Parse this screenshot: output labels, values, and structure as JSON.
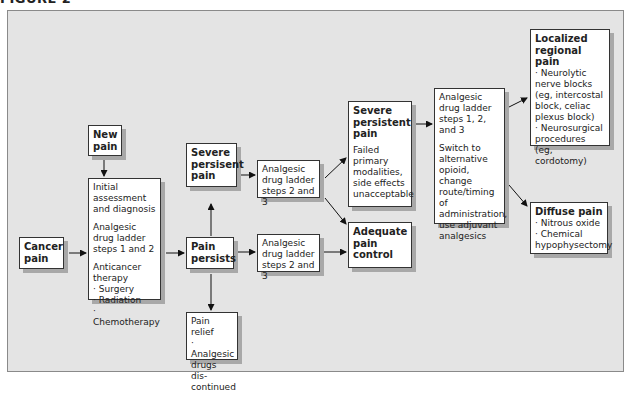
{
  "figure": {
    "title": "FIGURE 2"
  },
  "nodes": {
    "cancer_pain": {
      "title": [
        "Cancer",
        "pain"
      ]
    },
    "new_pain": {
      "title": [
        "New",
        "pain"
      ]
    },
    "initial": {
      "lines": [
        "Initial",
        "assessment",
        "and diagnosis"
      ],
      "ladder": [
        "Analgesic",
        "drug ladder",
        "steps 1 and 2"
      ],
      "therapy": [
        "Anticancer",
        "therapy",
        "· Surgery",
        "· Radiation",
        "· Chemotherapy"
      ]
    },
    "severe_left": {
      "title": [
        "Severe",
        "persisent",
        "pain"
      ]
    },
    "pain_persists": {
      "title": [
        "Pain",
        "persists"
      ]
    },
    "pain_relief": {
      "lines": [
        "Pain relief",
        "· Analgesic",
        "drugs dis-",
        "continued"
      ]
    },
    "ladder_top": {
      "lines": [
        "Analgesic",
        "drug ladder",
        "steps 2 and 3"
      ]
    },
    "ladder_bottom": {
      "lines": [
        "Analgesic",
        "drug ladder",
        "steps 2 and 3"
      ]
    },
    "severe_mid": {
      "title": [
        "Severe",
        "persistent",
        "pain"
      ],
      "lines": [
        "Failed",
        "primary",
        "modalities,",
        "side effects",
        "unacceptable"
      ]
    },
    "adequate": {
      "title": [
        "Adequate",
        "pain",
        "control"
      ]
    },
    "ladder_full": {
      "lines": [
        "Analgesic",
        "drug ladder",
        "steps 1, 2,",
        "and 3"
      ],
      "switch": [
        "Switch to",
        "alternative",
        "opioid, change",
        "route/timing of",
        "administration,",
        "use adjuvant",
        "analgesics"
      ]
    },
    "localized": {
      "title": [
        "Localized",
        "regional pain"
      ],
      "lines": [
        "· Neurolytic",
        "nerve blocks",
        "(eg, intercostal",
        "block, celiac",
        "plexus block)",
        "· Neurosurgical",
        "procedures",
        "(eg, cordotomy)"
      ]
    },
    "diffuse": {
      "title": [
        "Diffuse pain"
      ],
      "lines": [
        "· Nitrous oxide",
        "· Chemical",
        "hypophysectomy"
      ]
    }
  },
  "colors": {
    "frame_bg": "#e4e4e4",
    "box_bg": "#ffffff",
    "shadow": "#a8a8a8",
    "stroke": "#222222"
  }
}
